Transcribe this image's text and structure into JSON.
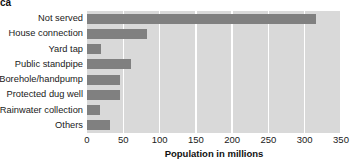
{
  "chart_title": "ca",
  "axis_title": "Population in millions",
  "colors": {
    "bar": "#808080",
    "plot_background": "#d9d9d9",
    "gridline": "#ffffff",
    "text": "#1a1a1a",
    "page_background": "#ffffff"
  },
  "chart_data": {
    "type": "bar",
    "orientation": "horizontal",
    "title": "ca",
    "xlabel": "Population in millions",
    "ylabel": "",
    "categories": [
      "Not served",
      "House connection",
      "Yard tap",
      "Public standpipe",
      "Borehole/handpump",
      "Protected dug well",
      "Rainwater collection",
      "Others"
    ],
    "values": [
      315,
      83,
      19,
      61,
      45,
      45,
      18,
      32
    ],
    "xlim": [
      0,
      350
    ],
    "xticks": [
      0,
      50,
      100,
      150,
      200,
      250,
      300,
      350
    ],
    "xtick_labels": [
      "0",
      "50",
      "100",
      "150",
      "200",
      "250",
      "300",
      "350"
    ],
    "grid": true,
    "grid_axis": "x",
    "legend": false,
    "legend_position": "none"
  }
}
